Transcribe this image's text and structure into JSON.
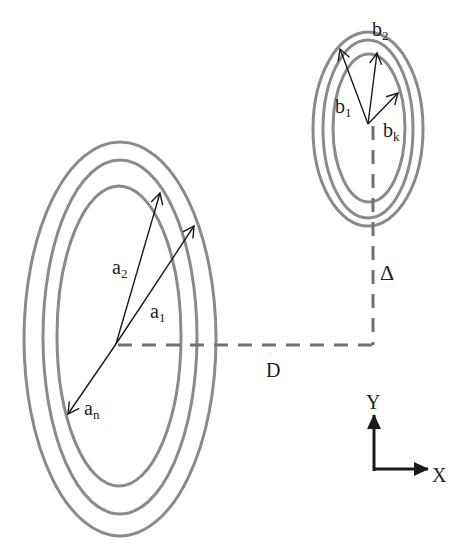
{
  "diagram": {
    "colors": {
      "ellipse": "#8a8a8a",
      "vector": "#1a1a1a",
      "dash": "#707070",
      "text": "#222222",
      "background": "#ffffff"
    },
    "large_coil": {
      "center": [
        116,
        344
      ],
      "rings": [
        {
          "rx": 96,
          "ry": 197,
          "cy": 339
        },
        {
          "rx": 77,
          "ry": 177,
          "cy": 337
        },
        {
          "rx": 62,
          "ry": 150,
          "cy": 336
        }
      ],
      "vectors": [
        {
          "label": "a",
          "sub": "2",
          "tip": [
            160,
            192
          ],
          "label_pos": [
            113,
            274
          ]
        },
        {
          "label": "a",
          "sub": "1",
          "tip": [
            194,
            225
          ],
          "label_pos": [
            150,
            317
          ]
        },
        {
          "label": "a",
          "sub": "n",
          "tip": [
            68,
            414
          ],
          "label_pos": [
            84,
            414
          ]
        }
      ]
    },
    "small_coil": {
      "center": [
        368,
        124
      ],
      "rings": [
        {
          "rx": 55,
          "ry": 97,
          "cy": 129
        },
        {
          "rx": 45,
          "ry": 89,
          "cy": 129
        },
        {
          "rx": 36,
          "ry": 74,
          "cy": 128
        }
      ],
      "vectors": [
        {
          "label": "b",
          "sub": "1",
          "tip": [
            340,
            48
          ],
          "label_pos": [
            336,
            112
          ]
        },
        {
          "label": "b",
          "sub": "2",
          "tip": [
            377,
            52
          ],
          "label_pos": [
            372,
            37
          ]
        },
        {
          "label": "b",
          "sub": "k",
          "tip": [
            399,
            92
          ],
          "label_pos": [
            383,
            136
          ]
        }
      ]
    },
    "dimensions": {
      "horizontal": {
        "label": "D",
        "from": [
          116,
          344
        ],
        "to": [
          373,
          344
        ],
        "label_pos": [
          267,
          376
        ]
      },
      "vertical": {
        "label": "Δ",
        "from": [
          373,
          124
        ],
        "to": [
          373,
          344
        ],
        "label_pos": [
          381,
          278
        ]
      }
    },
    "axes": {
      "origin": [
        375,
        471
      ],
      "x_label": "X",
      "y_label": "Y",
      "x_label_pos": [
        432,
        482
      ],
      "y_label_pos": [
        366,
        410
      ]
    }
  }
}
